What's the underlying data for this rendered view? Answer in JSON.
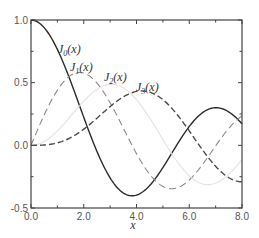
{
  "chart_data": {
    "type": "line",
    "title": "",
    "xlabel": "x",
    "ylabel": "",
    "xlim": [
      0.0,
      8.0
    ],
    "ylim": [
      -0.5,
      1.0
    ],
    "grid": false,
    "legend_position": "inline labels near curves",
    "x_ticks": [
      "0.0",
      "2.0",
      "4.0",
      "6.0",
      "8.0"
    ],
    "y_ticks": [
      "-0.5",
      "0.0",
      "0.5",
      "1.0"
    ],
    "series": [
      {
        "name": "J0(x)",
        "label_main": "J",
        "label_sub": "0",
        "label_arg": "(x)",
        "style": "solid",
        "color": "#2a2a2a",
        "x": [
          0,
          0.5,
          1,
          1.5,
          2,
          2.5,
          3,
          3.5,
          4,
          4.5,
          5,
          5.5,
          6,
          6.5,
          7,
          7.5,
          8
        ],
        "values": [
          1.0,
          0.938,
          0.765,
          0.512,
          0.224,
          -0.048,
          -0.26,
          -0.38,
          -0.397,
          -0.321,
          -0.178,
          -0.007,
          0.151,
          0.26,
          0.3,
          0.266,
          0.172
        ]
      },
      {
        "name": "J1(x)",
        "label_main": "J",
        "label_sub": "1",
        "label_arg": "(x)",
        "style": "long-dash",
        "color": "#8a8a8a",
        "x": [
          0,
          0.5,
          1,
          1.5,
          2,
          2.5,
          3,
          3.5,
          4,
          4.5,
          5,
          5.5,
          6,
          6.5,
          7,
          7.5,
          8
        ],
        "values": [
          0.0,
          0.242,
          0.44,
          0.558,
          0.577,
          0.497,
          0.339,
          0.137,
          -0.066,
          -0.231,
          -0.328,
          -0.341,
          -0.277,
          -0.154,
          -0.005,
          0.135,
          0.235
        ]
      },
      {
        "name": "J2(x)",
        "label_main": "J",
        "label_sub": "2",
        "label_arg": "(x)",
        "style": "faint",
        "color": "#e2e2e2",
        "x": [
          0,
          0.5,
          1,
          1.5,
          2,
          2.5,
          3,
          3.5,
          4,
          4.5,
          5,
          5.5,
          6,
          6.5,
          7,
          7.5,
          8
        ],
        "values": [
          0.0,
          0.031,
          0.115,
          0.232,
          0.353,
          0.446,
          0.486,
          0.459,
          0.364,
          0.218,
          0.047,
          -0.117,
          -0.243,
          -0.307,
          -0.301,
          -0.23,
          -0.113
        ]
      },
      {
        "name": "J3(x)",
        "label_main": "J",
        "label_sub": "3",
        "label_arg": "(x)",
        "style": "dash",
        "color": "#4a4a4a",
        "x": [
          0,
          0.5,
          1,
          1.5,
          2,
          2.5,
          3,
          3.5,
          4,
          4.5,
          5,
          5.5,
          6,
          6.5,
          7,
          7.5,
          8
        ],
        "values": [
          0.0,
          0.003,
          0.02,
          0.061,
          0.129,
          0.217,
          0.309,
          0.387,
          0.43,
          0.425,
          0.365,
          0.256,
          0.115,
          -0.035,
          -0.168,
          -0.258,
          -0.291
        ]
      }
    ]
  },
  "axes": {
    "x_label": "x",
    "x_ticks": [
      {
        "v": 0,
        "label": "0.0"
      },
      {
        "v": 2,
        "label": "2.0"
      },
      {
        "v": 4,
        "label": "4.0"
      },
      {
        "v": 6,
        "label": "6.0"
      },
      {
        "v": 8,
        "label": "8.0"
      }
    ],
    "y_ticks": [
      {
        "v": -0.5,
        "label": "-0.5"
      },
      {
        "v": 0,
        "label": "0.0"
      },
      {
        "v": 0.5,
        "label": "0.5"
      },
      {
        "v": 1.0,
        "label": "1.0"
      }
    ]
  },
  "labels": [
    {
      "series": 0,
      "x": 58,
      "y": 53
    },
    {
      "series": 1,
      "x": 70,
      "y": 71
    },
    {
      "series": 2,
      "x": 104,
      "y": 81
    },
    {
      "series": 3,
      "x": 136,
      "y": 91
    }
  ],
  "colors": {
    "axis": "#444444",
    "background": "#ffffff"
  }
}
